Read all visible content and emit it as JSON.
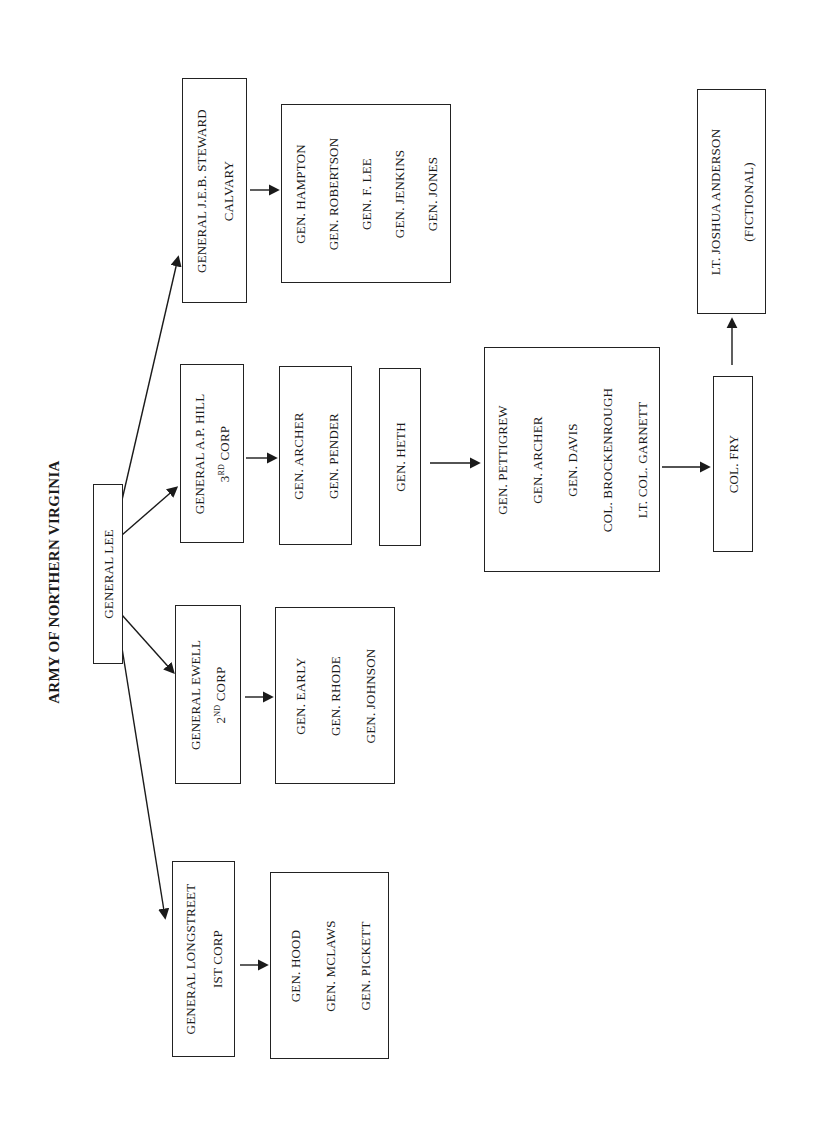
{
  "title": "ARMY OF NORTHERN VIRGINIA",
  "root": {
    "label": "GENERAL LEE"
  },
  "corps": [
    {
      "id": "stuart",
      "lines": [
        "GENERAL J.E.B. STEWARD",
        "CALVARY"
      ],
      "subordinates": [
        "GEN. HAMPTON",
        "GEN. ROBERTSON",
        "GEN. F.  LEE",
        "GEN. JENKINS",
        "GEN. JONES"
      ]
    },
    {
      "id": "hill",
      "lines": [
        "GENERAL A.P. HILL",
        "3RD CORP"
      ],
      "ordinal": {
        "num": "3",
        "sup": "RD",
        "rest": " CORP"
      },
      "subordinates": [
        "GEN. ARCHER",
        "GEN. PENDER"
      ],
      "extra": "GEN. HETH"
    },
    {
      "id": "ewell",
      "lines": [
        "GENERAL EWELL",
        "2ND CORP"
      ],
      "ordinal": {
        "num": "2",
        "sup": "ND",
        "rest": " CORP"
      },
      "subordinates": [
        "GEN. EARLY",
        "GEN. RHODE",
        "GEN. JOHNSON"
      ]
    },
    {
      "id": "longstreet",
      "lines": [
        "GENERAL LONGSTREET",
        "IST CORP"
      ],
      "subordinates": [
        "GEN. HOOD",
        "GEN. MCLAWS",
        "GEN. PICKETT"
      ]
    }
  ],
  "heth_division": [
    "GEN. PETTIGREW",
    "GEN. ARCHER",
    "GEN. DAVIS",
    "COL. BROCKENROUGH",
    "LT. COL. GARNETT"
  ],
  "fry": "COL. FRY",
  "anderson": [
    "LT. JOSHUA ANDERSON",
    "(FICTIONAL)"
  ],
  "colors": {
    "ink": "#1a1a1a",
    "border": "#222222",
    "background": "#ffffff"
  }
}
